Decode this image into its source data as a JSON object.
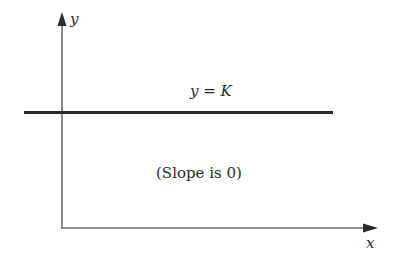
{
  "diagram": {
    "axes": {
      "x_label": "x",
      "y_label": "y"
    },
    "line": {
      "label": "y = K",
      "slope_note": "(Slope is 0)"
    },
    "colors": {
      "axis": "#6e6e6e",
      "line": "#2b2b2b",
      "text": "#2a2a2a",
      "background": "#ffffff"
    }
  }
}
